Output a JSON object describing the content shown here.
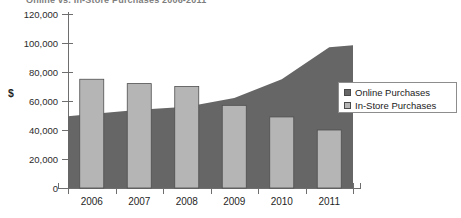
{
  "chart_data": {
    "type": "bar",
    "title": "Online vs. In-Store Purchases 2006-2011",
    "xlabel": "",
    "ylabel": "$",
    "categories": [
      "2006",
      "2007",
      "2008",
      "2009",
      "2010",
      "2011"
    ],
    "ylim": [
      0,
      120000
    ],
    "ytick_labels": [
      "0",
      "20,000",
      "40,000",
      "60,000",
      "80,000",
      "100,000",
      "120,000"
    ],
    "ytick_values": [
      0,
      20000,
      40000,
      60000,
      80000,
      100000,
      120000
    ],
    "grid": false,
    "legend_position": "right",
    "series": [
      {
        "name": "Online Purchases",
        "render": "area",
        "color": "#666666",
        "values": [
          51000,
          54000,
          56000,
          62000,
          75000,
          97000
        ]
      },
      {
        "name": "In-Store Purchases",
        "render": "bar",
        "color": "#b5b5b5",
        "values": [
          75000,
          72000,
          70000,
          57000,
          49000,
          40000
        ]
      }
    ]
  },
  "legend": {
    "items": [
      {
        "label": "Online Purchases",
        "color": "#666666"
      },
      {
        "label": "In-Store Purchases",
        "color": "#b5b5b5"
      }
    ]
  }
}
